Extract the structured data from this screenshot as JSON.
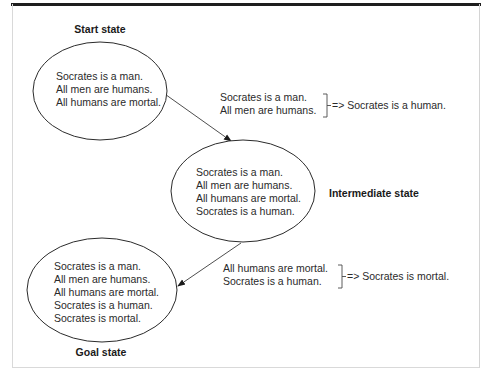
{
  "diagram": {
    "colors": {
      "stroke": "#2b2b2b",
      "text": "#2a2a2a",
      "rule": "#1e1e1e",
      "frame": "#d9d9d9"
    },
    "states": [
      {
        "id": "start",
        "label": "Start state",
        "facts": [
          "Socrates is a man.",
          "All men are humans.",
          "All humans are mortal."
        ]
      },
      {
        "id": "intermediate",
        "label": "Intermediate state",
        "facts": [
          "Socrates is a man.",
          "All men are humans.",
          "All humans are mortal.",
          "Socrates is a human."
        ]
      },
      {
        "id": "goal",
        "label": "Goal state",
        "facts": [
          "Socrates is a man.",
          "All men are humans.",
          "All humans are mortal.",
          "Socrates is a human.",
          "Socrates is mortal."
        ]
      }
    ],
    "transitions": [
      {
        "from": "start",
        "to": "intermediate",
        "premises": [
          "Socrates is a man.",
          "All men are humans."
        ],
        "conclusion": "=> Socrates is a human."
      },
      {
        "from": "intermediate",
        "to": "goal",
        "premises": [
          "All humans are mortal.",
          "Socrates is a human."
        ],
        "conclusion": "=> Socrates is mortal."
      }
    ]
  }
}
